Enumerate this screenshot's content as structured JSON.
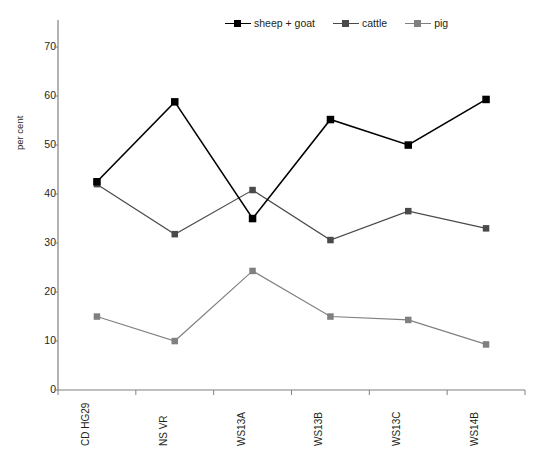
{
  "chart_data": {
    "type": "line",
    "title": "",
    "xlabel": "",
    "ylabel": "per cent",
    "categories": [
      "CD HG29",
      "NS VR",
      "WS13A",
      "WS13B",
      "WS13C",
      "WS14B"
    ],
    "ylim": [
      0,
      75
    ],
    "yticks": [
      0,
      10,
      20,
      30,
      40,
      50,
      60,
      70
    ],
    "ytick_labels": [
      "0",
      "10",
      "20",
      "30",
      "40",
      "50",
      "60",
      "70"
    ],
    "grid": false,
    "legend_position": "top-center",
    "series": [
      {
        "name": "sheep + goat",
        "color": "#000000",
        "marker": "square",
        "values": [
          42.5,
          58.8,
          35.0,
          55.2,
          50.0,
          59.3
        ]
      },
      {
        "name": "cattle",
        "color": "#4a4a4a",
        "marker": "square",
        "values": [
          42.0,
          31.8,
          40.8,
          30.6,
          36.5,
          33.0
        ]
      },
      {
        "name": "pig",
        "color": "#808080",
        "marker": "square",
        "values": [
          15.0,
          10.0,
          24.3,
          15.0,
          14.3,
          9.3
        ]
      }
    ]
  },
  "axis": {
    "y_title": "per cent"
  },
  "legend": {
    "entries": [
      {
        "label": "sheep + goat",
        "color": "#000000"
      },
      {
        "label": "cattle",
        "color": "#4a4a4a"
      },
      {
        "label": "pig",
        "color": "#808080"
      }
    ]
  },
  "colors": {
    "axis": "#808080",
    "text": "#231f20",
    "background": "#ffffff"
  }
}
